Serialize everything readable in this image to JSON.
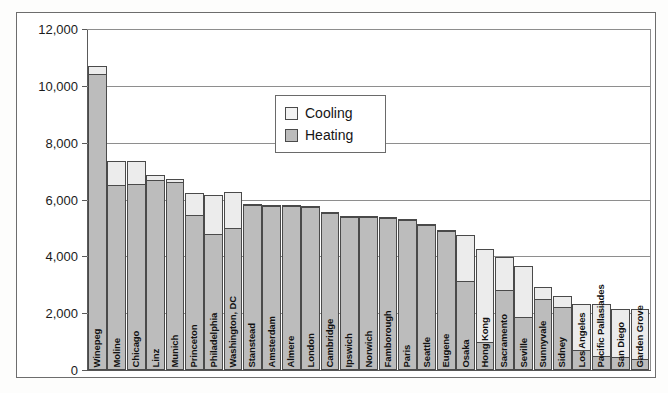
{
  "chart_data": {
    "type": "bar",
    "subtype": "stacked-column",
    "title": "",
    "xlabel": "",
    "ylabel": "",
    "ylim": [
      0,
      12000
    ],
    "y_ticks": [
      0,
      2000,
      4000,
      6000,
      8000,
      10000,
      12000
    ],
    "y_tick_labels": [
      "0",
      "2,000",
      "4,000",
      "6,000",
      "8,000",
      "10,000",
      "12,000"
    ],
    "grid": true,
    "legend_position": "inside-top-center",
    "legend": [
      "Cooling",
      "Heating"
    ],
    "colors": {
      "cooling": "#ececec",
      "heating": "#bcbcbc",
      "bar_outline": "#4a4a4a",
      "gridline": "#8e8e8e",
      "frame": "#6d6d6d",
      "text": "#111111"
    },
    "categories": [
      "Winepeg",
      "Moline",
      "Chicago",
      "Linz",
      "Munich",
      "Princeton",
      "Philadelphia",
      "Washington, DC",
      "Stanstead",
      "Amsterdam",
      "Almere",
      "London",
      "Cambridge",
      "Ipswich",
      "Norwich",
      "Famborough",
      "Paris",
      "Seattle",
      "Eugene",
      "Osaka",
      "Hong Kong",
      "Sacramento",
      "Seville",
      "Sunnyvale",
      "Sidney",
      "Los Angeles",
      "Pacific Pallasiades",
      "San Diego",
      "Garden Grove"
    ],
    "series": [
      {
        "name": "Heating",
        "values": [
          10400,
          6500,
          6550,
          6700,
          6600,
          5450,
          4800,
          5000,
          5800,
          5780,
          5770,
          5750,
          5520,
          5400,
          5380,
          5360,
          5280,
          5120,
          4880,
          3150,
          1000,
          2800,
          1850,
          2500,
          2200,
          700,
          500,
          450,
          400
        ]
      },
      {
        "name": "Cooling",
        "values": [
          350,
          900,
          850,
          200,
          150,
          800,
          1400,
          1300,
          30,
          20,
          20,
          20,
          20,
          20,
          20,
          20,
          20,
          20,
          20,
          1650,
          3300,
          1200,
          1850,
          450,
          450,
          1650,
          1850,
          1750,
          1800
        ]
      }
    ],
    "totals": [
      10750,
      7400,
      7400,
      6900,
      6750,
      6250,
      6200,
      6300,
      5830,
      5800,
      5790,
      5770,
      5540,
      5420,
      5400,
      5380,
      5300,
      5140,
      4900,
      4800,
      4300,
      4000,
      3700,
      2950,
      2650,
      2350,
      2350,
      2200,
      2200
    ]
  }
}
